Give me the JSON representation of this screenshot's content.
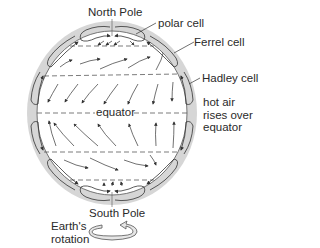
{
  "diagram": {
    "labels": {
      "north_pole": "North Pole",
      "south_pole": "South Pole",
      "polar_cell": "polar cell",
      "ferrel_cell": "Ferrel cell",
      "hadley_cell": "Hadley cell",
      "hot_air_1": "hot air",
      "hot_air_2": "rises over",
      "hot_air_3": "equator",
      "equator": "equator",
      "rotation_1": "Earth's",
      "rotation_2": "rotation"
    },
    "colors": {
      "atmosphere": "#d4d4d4",
      "cell_fill": "#c8c8c8",
      "line": "#333333",
      "text": "#2a2a2a"
    }
  }
}
